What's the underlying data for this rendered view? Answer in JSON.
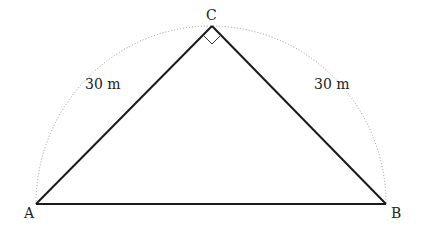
{
  "diagram": {
    "type": "geometry",
    "vertices": {
      "A": {
        "label": "A",
        "x": 36,
        "y": 204
      },
      "B": {
        "label": "B",
        "x": 386,
        "y": 204
      },
      "C": {
        "label": "C",
        "x": 212,
        "y": 26
      }
    },
    "right_angle_at": "C",
    "edges": [
      {
        "from": "A",
        "to": "C",
        "label": "30 m"
      },
      {
        "from": "C",
        "to": "B",
        "label": "30 m"
      },
      {
        "from": "A",
        "to": "B",
        "label": ""
      }
    ],
    "arc": {
      "style": "dotted",
      "type": "semicircle",
      "diameter": "AB"
    },
    "colors": {
      "lines": "#1a1a1a",
      "arc": "#999999",
      "text": "#222222"
    }
  },
  "labels": {
    "A": "A",
    "B": "B",
    "C": "C",
    "AC": "30 m",
    "CB": "30 m"
  }
}
